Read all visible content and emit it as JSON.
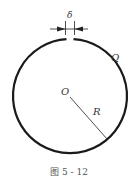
{
  "diagram": {
    "labels": {
      "gap": "δ",
      "ring": "Q",
      "center": "O",
      "radius": "R"
    },
    "caption": "图 5 - 12",
    "colors": {
      "stroke": "#1a1a1a",
      "text": "#333333",
      "caption": "#555555"
    }
  }
}
